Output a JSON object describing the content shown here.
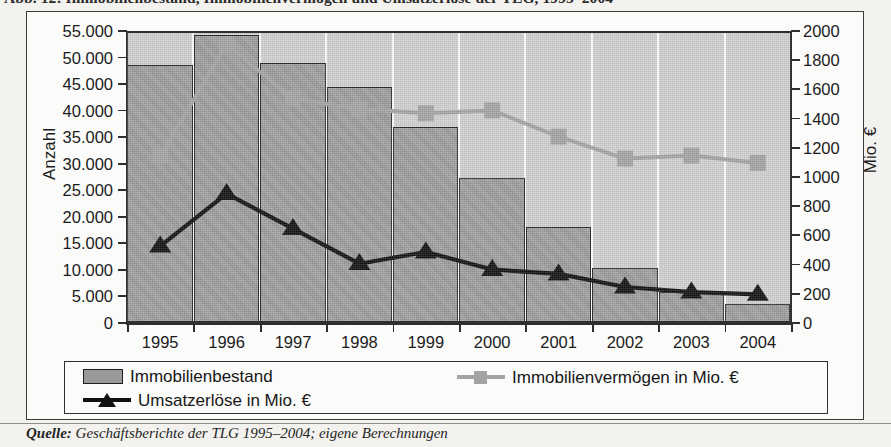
{
  "figure": {
    "caption": "Abb. 12:  Immobilienbestand, Immobilienvermögen und Umsatzerlöse der TLG, 1995–2004",
    "source_label": "Quelle:",
    "source_text": " Geschäftsberichte der TLG 1995–2004; eigene Berechnungen"
  },
  "chart_data": {
    "type": "bar",
    "title": "Immobilienbestand, Immobilienvermögen und Umsatzerlöse der TLG, 1995–2004",
    "xlabel": "",
    "ylabel": "Anzahl",
    "ylabel_secondary": "Mio. €",
    "categories": [
      "1995",
      "1996",
      "1997",
      "1998",
      "1999",
      "2000",
      "2001",
      "2002",
      "2003",
      "2004"
    ],
    "ylim": [
      0,
      55000
    ],
    "ylim_secondary": [
      0,
      2000
    ],
    "yticks": [
      "0",
      "5.000",
      "10.000",
      "15.000",
      "20.000",
      "25.000",
      "30.000",
      "35.000",
      "40.000",
      "45.000",
      "50.000",
      "55.000"
    ],
    "ytick_values": [
      0,
      5000,
      10000,
      15000,
      20000,
      25000,
      30000,
      35000,
      40000,
      45000,
      50000,
      55000
    ],
    "yticks_secondary": [
      "0",
      "200",
      "400",
      "600",
      "800",
      "1000",
      "1200",
      "1400",
      "1600",
      "1800",
      "2000"
    ],
    "ytick_values_secondary": [
      0,
      200,
      400,
      600,
      800,
      1000,
      1200,
      1400,
      1600,
      1800,
      2000
    ],
    "grid": "vertical-white",
    "legend_position": "below-plot",
    "series": [
      {
        "name": "Immobilienbestand",
        "kind": "bar",
        "axis": "left",
        "color": "#9a9a9a",
        "values": [
          48300,
          53800,
          48600,
          44000,
          36500,
          27000,
          17800,
          10000,
          5500,
          3200
        ]
      },
      {
        "name": "Immobilienvermögen in Mio. €",
        "kind": "line",
        "axis": "right",
        "color": "#a3a3a3",
        "marker": "square",
        "values": [
          1160,
          1920,
          1550,
          1480,
          1450,
          1470,
          1290,
          1140,
          1160,
          1110
        ]
      },
      {
        "name": "Umsatzerlöse in Mio. €",
        "kind": "line",
        "axis": "right",
        "color": "#111111",
        "marker": "triangle",
        "values": [
          540,
          900,
          660,
          420,
          500,
          380,
          350,
          260,
          225,
          210
        ]
      }
    ]
  },
  "legend": {
    "items": [
      {
        "label": "Immobilienbestand",
        "marker": "bar-swatch"
      },
      {
        "label": "Immobilienvermögen in Mio. €",
        "marker": "square-line"
      },
      {
        "label": "Umsatzerlöse in Mio. €",
        "marker": "triangle-line"
      }
    ]
  }
}
